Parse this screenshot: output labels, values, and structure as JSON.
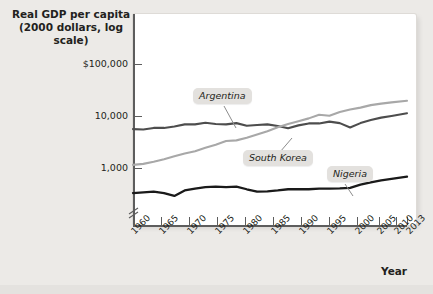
{
  "axes": {
    "y_title_line1": "Real GDP per capita",
    "y_title_line2": "(2000 dollars, log scale)",
    "x_title": "Year",
    "y_ticks": [
      "$100,000",
      "10,000",
      "1,000"
    ],
    "x_ticks": [
      "1960",
      "1965",
      "1970",
      "1975",
      "1980",
      "1985",
      "1990",
      "1995",
      "2000",
      "2005",
      "2010",
      "2013"
    ]
  },
  "labels": {
    "argentina": "Argentina",
    "south_korea": "South Korea",
    "nigeria": "Nigeria"
  },
  "colors": {
    "argentina": "#4d4d4d",
    "south_korea": "#a8a8a8",
    "nigeria": "#1a1a1a",
    "axis": "#5d5d5d",
    "plot_bg": "#ffffff",
    "page_bg": "#eceae7",
    "callout_bg": "#e3e1de"
  },
  "chart_data": {
    "type": "line",
    "title": "Real GDP per capita (2000 dollars, log scale)",
    "xlabel": "Year",
    "ylabel": "Real GDP per capita (2000 dollars, log scale)",
    "y_scale": "log",
    "ylim": [
      250,
      200000
    ],
    "y_tick_values": [
      100000,
      10000,
      1000
    ],
    "y_tick_labels": [
      "$100,000",
      "10,000",
      "1,000"
    ],
    "xlim": [
      1960,
      2013
    ],
    "x_tick_values": [
      1960,
      1965,
      1970,
      1975,
      1980,
      1985,
      1990,
      1995,
      2000,
      2005,
      2010,
      2013
    ],
    "grid": false,
    "legend_position": "inline-callouts",
    "axis_break_on_y": true,
    "series": [
      {
        "name": "Argentina",
        "color": "#4d4d4d",
        "x": [
          1960,
          1962,
          1964,
          1966,
          1968,
          1970,
          1972,
          1974,
          1976,
          1978,
          1980,
          1982,
          1984,
          1986,
          1988,
          1990,
          1992,
          1994,
          1996,
          1998,
          2000,
          2002,
          2004,
          2006,
          2008,
          2010,
          2013
        ],
        "values": [
          5600,
          5500,
          5900,
          5900,
          6300,
          6900,
          6900,
          7400,
          7000,
          6900,
          7300,
          6500,
          6700,
          6900,
          6400,
          5800,
          6600,
          7200,
          7200,
          7800,
          7300,
          6000,
          7300,
          8400,
          9300,
          10000,
          11300
        ]
      },
      {
        "name": "South Korea",
        "color": "#a8a8a8",
        "x": [
          1960,
          1962,
          1964,
          1966,
          1968,
          1970,
          1972,
          1974,
          1976,
          1978,
          1980,
          1982,
          1984,
          1986,
          1988,
          1990,
          1992,
          1994,
          1996,
          1998,
          2000,
          2002,
          2004,
          2006,
          2008,
          2010,
          2013
        ],
        "values": [
          1150,
          1200,
          1320,
          1480,
          1680,
          1900,
          2100,
          2450,
          2800,
          3300,
          3400,
          3800,
          4400,
          5100,
          6100,
          7000,
          7900,
          9000,
          10600,
          10100,
          11900,
          13300,
          14500,
          16200,
          17300,
          18300,
          19600
        ]
      },
      {
        "name": "Nigeria",
        "color": "#1a1a1a",
        "x": [
          1960,
          1962,
          1964,
          1966,
          1968,
          1970,
          1972,
          1974,
          1976,
          1978,
          1980,
          1982,
          1984,
          1986,
          1988,
          1990,
          1992,
          1994,
          1996,
          1998,
          2000,
          2002,
          2004,
          2006,
          2008,
          2010,
          2013
        ],
        "values": [
          330,
          340,
          350,
          330,
          290,
          370,
          400,
          430,
          440,
          430,
          440,
          390,
          350,
          355,
          370,
          390,
          390,
          390,
          400,
          400,
          405,
          415,
          480,
          530,
          580,
          620,
          680
        ]
      }
    ]
  }
}
